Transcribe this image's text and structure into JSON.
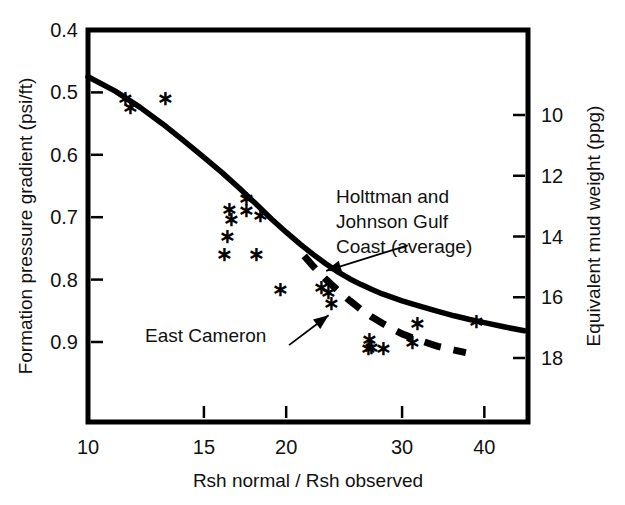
{
  "chart_data": {
    "type": "scatter",
    "title": "",
    "xlabel": "Rsh normal / Rsh observed",
    "ylabel": "Formation pressure gradient (psi/ft)",
    "ylabel_right": "Equivalent mud weight (ppg)",
    "xscale": "log",
    "xlim": [
      10,
      46
    ],
    "ylim": [
      0.4,
      0.95
    ],
    "grid": false,
    "legend_position": "none",
    "x_ticks": [
      {
        "value": 10,
        "label": "10"
      },
      {
        "value": 15,
        "label": "15"
      },
      {
        "value": 20,
        "label": "20"
      },
      {
        "value": 30,
        "label": "30"
      },
      {
        "value": 40,
        "label": "40"
      }
    ],
    "y_ticks_left": [
      {
        "value": 0.4,
        "label": "0.4"
      },
      {
        "value": 0.5,
        "label": "0.5"
      },
      {
        "value": 0.6,
        "label": "0.6"
      },
      {
        "value": 0.7,
        "label": "0.7"
      },
      {
        "value": 0.8,
        "label": "0.8"
      },
      {
        "value": 0.9,
        "label": "0.9"
      }
    ],
    "y_ticks_right": [
      {
        "value": 10,
        "label": "10"
      },
      {
        "value": 12,
        "label": "12"
      },
      {
        "value": 14,
        "label": "14"
      },
      {
        "value": 16,
        "label": "16"
      },
      {
        "value": 18,
        "label": "18"
      }
    ],
    "series": [
      {
        "name": "Holttman and Johnson Gulf Coast (average)",
        "type": "line",
        "style": "solid",
        "color": "#000000",
        "points": [
          [
            10.0,
            0.475
          ],
          [
            11.0,
            0.498
          ],
          [
            12.0,
            0.524
          ],
          [
            13.0,
            0.551
          ],
          [
            14.0,
            0.578
          ],
          [
            15.0,
            0.604
          ],
          [
            16.0,
            0.629
          ],
          [
            17.0,
            0.654
          ],
          [
            18.0,
            0.679
          ],
          [
            19.0,
            0.703
          ],
          [
            20.0,
            0.724
          ],
          [
            21.0,
            0.743
          ],
          [
            22.0,
            0.76
          ],
          [
            23.0,
            0.775
          ],
          [
            24.0,
            0.788
          ],
          [
            25.0,
            0.799
          ],
          [
            26.0,
            0.808
          ],
          [
            27.0,
            0.816
          ],
          [
            28.0,
            0.823
          ],
          [
            30.0,
            0.834
          ],
          [
            32.0,
            0.843
          ],
          [
            34.0,
            0.851
          ],
          [
            36.0,
            0.858
          ],
          [
            38.0,
            0.864
          ],
          [
            40.0,
            0.869
          ],
          [
            43.0,
            0.876
          ],
          [
            46.0,
            0.882
          ]
        ]
      },
      {
        "name": "East Cameron",
        "type": "line",
        "style": "dashed",
        "color": "#000000",
        "points": [
          [
            21.3,
            0.762
          ],
          [
            22.0,
            0.779
          ],
          [
            23.0,
            0.8
          ],
          [
            24.0,
            0.818
          ],
          [
            25.0,
            0.834
          ],
          [
            26.0,
            0.848
          ],
          [
            27.0,
            0.86
          ],
          [
            28.0,
            0.87
          ],
          [
            29.0,
            0.879
          ],
          [
            30.0,
            0.887
          ],
          [
            32.0,
            0.898
          ],
          [
            34.0,
            0.907
          ],
          [
            36.0,
            0.913
          ],
          [
            37.5,
            0.917
          ]
        ]
      },
      {
        "name": "Field data points",
        "type": "scatter",
        "marker": "asterisk",
        "color": "#000000",
        "points": [
          [
            11.4,
            0.512
          ],
          [
            11.6,
            0.527
          ],
          [
            13.1,
            0.512
          ],
          [
            16.4,
            0.69
          ],
          [
            16.5,
            0.706
          ],
          [
            16.3,
            0.733
          ],
          [
            17.4,
            0.673
          ],
          [
            17.4,
            0.691
          ],
          [
            18.3,
            0.7
          ],
          [
            16.1,
            0.762
          ],
          [
            18.0,
            0.762
          ],
          [
            19.6,
            0.818
          ],
          [
            22.6,
            0.815
          ],
          [
            23.2,
            0.823
          ],
          [
            23.4,
            0.841
          ],
          [
            26.8,
            0.899
          ],
          [
            26.7,
            0.913
          ],
          [
            27.0,
            0.912
          ],
          [
            28.1,
            0.913
          ],
          [
            31.7,
            0.872
          ],
          [
            31.1,
            0.903
          ],
          [
            38.9,
            0.87
          ]
        ]
      }
    ],
    "annotations": [
      {
        "id": "holttman",
        "lines": [
          "Holttman and",
          "Johnson Gulf",
          "Coast (average)"
        ],
        "arrow_from": [
          30.6,
          0.745
        ],
        "arrow_to": [
          23.0,
          0.786
        ]
      },
      {
        "id": "east-cameron",
        "lines": [
          "East Cameron"
        ],
        "arrow_from": [
          20.2,
          0.905
        ],
        "arrow_to": [
          23.2,
          0.857
        ]
      }
    ]
  }
}
